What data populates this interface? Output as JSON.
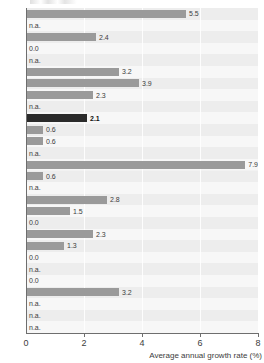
{
  "chart_data": {
    "type": "bar",
    "orientation": "horizontal",
    "title": "",
    "xlabel": "Average annual growth rate (%)",
    "ylabel": "",
    "xlim": [
      0,
      8
    ],
    "xticks": [
      0,
      2,
      4,
      6,
      8
    ],
    "xtick_labels": [
      "0",
      "2",
      "4",
      "6",
      "8"
    ],
    "grid": true,
    "grid_axis": "x",
    "legend": false,
    "na_text": "n.a.",
    "highlight_color": "#2b2b2b",
    "bar_color": "#9a9a9a",
    "plot_background": "#f2f2f2",
    "categories": [
      "",
      "",
      "",
      "",
      "",
      "",
      "",
      "",
      "",
      "",
      "",
      "",
      "",
      "",
      "",
      "",
      "",
      "",
      "",
      "",
      "",
      "",
      "",
      "",
      ""
    ],
    "values": [
      5.5,
      null,
      2.4,
      0.0,
      null,
      3.2,
      3.9,
      2.3,
      null,
      2.1,
      0.6,
      0.6,
      null,
      7.9,
      0.6,
      null,
      2.8,
      1.5,
      0.0,
      2.3,
      1.3,
      0.0,
      null,
      0.0,
      3.2
    ],
    "bars": [
      {
        "value": 5.5,
        "label": "5.5",
        "na": false,
        "highlight": false
      },
      {
        "value": null,
        "label": "n.a.",
        "na": true,
        "highlight": false
      },
      {
        "value": 2.4,
        "label": "2.4",
        "na": false,
        "highlight": false
      },
      {
        "value": 0.0,
        "label": "0.0",
        "na": false,
        "highlight": false
      },
      {
        "value": null,
        "label": "n.a.",
        "na": true,
        "highlight": false
      },
      {
        "value": 3.2,
        "label": "3.2",
        "na": false,
        "highlight": false
      },
      {
        "value": 3.9,
        "label": "3.9",
        "na": false,
        "highlight": false
      },
      {
        "value": 2.3,
        "label": "2.3",
        "na": false,
        "highlight": false
      },
      {
        "value": null,
        "label": "n.a.",
        "na": true,
        "highlight": false
      },
      {
        "value": 2.1,
        "label": "2.1",
        "na": false,
        "highlight": true
      },
      {
        "value": 0.6,
        "label": "0.6",
        "na": false,
        "highlight": false
      },
      {
        "value": 0.6,
        "label": "0.6",
        "na": false,
        "highlight": false
      },
      {
        "value": null,
        "label": "n.a.",
        "na": true,
        "highlight": false
      },
      {
        "value": 7.9,
        "label": "7.9",
        "na": false,
        "highlight": false
      },
      {
        "value": 0.6,
        "label": "0.6",
        "na": false,
        "highlight": false
      },
      {
        "value": null,
        "label": "n.a.",
        "na": true,
        "highlight": false
      },
      {
        "value": 2.8,
        "label": "2.8",
        "na": false,
        "highlight": false
      },
      {
        "value": 1.5,
        "label": "1.5",
        "na": false,
        "highlight": false
      },
      {
        "value": 0.0,
        "label": "0.0",
        "na": false,
        "highlight": false
      },
      {
        "value": 2.3,
        "label": "2.3",
        "na": false,
        "highlight": false
      },
      {
        "value": 1.3,
        "label": "1.3",
        "na": false,
        "highlight": false
      },
      {
        "value": 0.0,
        "label": "0.0",
        "na": false,
        "highlight": false
      },
      {
        "value": null,
        "label": "n.a.",
        "na": true,
        "highlight": false
      },
      {
        "value": 0.0,
        "label": "0.0",
        "na": false,
        "highlight": false
      },
      {
        "value": 3.2,
        "label": "3.2",
        "na": false,
        "highlight": false
      },
      {
        "value": null,
        "label": "n.a.",
        "na": true,
        "highlight": false
      },
      {
        "value": null,
        "label": "n.a.",
        "na": true,
        "highlight": false
      },
      {
        "value": null,
        "label": "n.a.",
        "na": true,
        "highlight": false
      }
    ]
  }
}
